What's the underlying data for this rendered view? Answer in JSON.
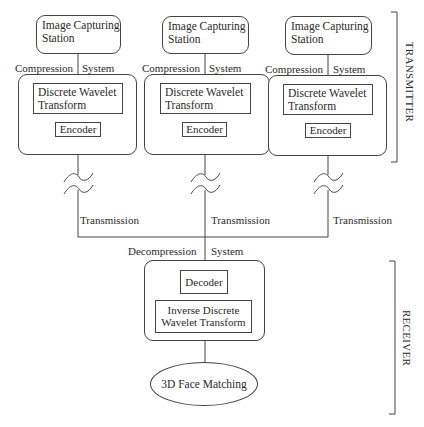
{
  "diagram": {
    "transmitters": [
      {
        "station_label": "Image Capturing Station",
        "station_line1": "Image Capturing",
        "station_line2": "Station",
        "compression_left": "Compression",
        "compression_right": "System",
        "dwt_line1": "Discrete Wavelet",
        "dwt_line2": "Transform",
        "encoder": "Encoder",
        "transmission": "Transmission"
      },
      {
        "station_line1": "Image Capturing",
        "station_line2": "Station",
        "compression_left": "Compression",
        "compression_right": "System",
        "dwt_line1": "Discrete Wavelet",
        "dwt_line2": "Transform",
        "encoder": "Encoder",
        "transmission": "Transmission"
      },
      {
        "station_line1": "Image Capturing",
        "station_line2": "Station",
        "compression_left": "Compression",
        "compression_right": "System",
        "dwt_line1": "Discrete Wavelet",
        "dwt_line2": "Transform",
        "encoder": "Encoder",
        "transmission": "Transmission"
      }
    ],
    "receiver": {
      "decompression_left": "Decompression",
      "decompression_right": "System",
      "decoder": "Decoder",
      "idwt_line1": "Inverse Discrete",
      "idwt_line2": "Wavelet Transform",
      "matching": "3D Face Matching"
    },
    "brackets": {
      "transmitter_label": "TRANSMITTER",
      "receiver_label": "RECEIVER"
    },
    "colors": {
      "line": "#444444",
      "text": "#2a2a2a",
      "background": "#ffffff"
    }
  }
}
